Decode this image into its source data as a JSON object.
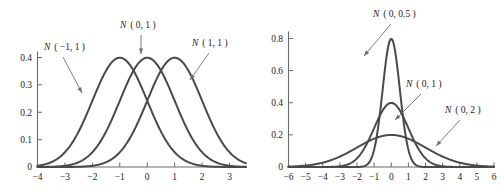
{
  "figure": {
    "title": "",
    "panels": [
      "left",
      "right"
    ]
  },
  "chart_data": [
    {
      "type": "line",
      "panel": "left",
      "title": "",
      "xlabel": "",
      "ylabel": "",
      "xlim": [
        -4,
        3.6
      ],
      "ylim": [
        0,
        0.42
      ],
      "xticks": [
        -4,
        -3,
        -2,
        -1,
        0,
        1,
        2,
        3
      ],
      "xticklabels": [
        "−4",
        "−3",
        "−2",
        "−1",
        "0",
        "1",
        "2",
        "3"
      ],
      "yticks": [
        0,
        0.1,
        0.2,
        0.3,
        0.4
      ],
      "yticklabels": [
        "0",
        "0.1",
        "0.2",
        "0.3",
        "0.4"
      ],
      "grid": false,
      "legend": "annotations",
      "series": [
        {
          "name": "N ( −1, 1 )",
          "label_plain": "N(-1,1)",
          "distribution": "normal",
          "mean": -1,
          "sigma": 1,
          "peak_value": 0.399,
          "peak_x": -1,
          "annotation": {
            "text_x": 44,
            "text_y": 50,
            "arrow_from_x": 63,
            "arrow_from_y": 57,
            "arrow_to_x": 82,
            "arrow_to_y": 93
          }
        },
        {
          "name": "N ( 0, 1 )",
          "label_plain": "N(0,1)",
          "distribution": "normal",
          "mean": 0,
          "sigma": 1,
          "peak_value": 0.399,
          "peak_x": 0,
          "annotation": {
            "text_x": 120,
            "text_y": 28,
            "arrow_from_x": 141,
            "arrow_from_y": 35,
            "arrow_to_x": 141,
            "arrow_to_y": 54
          }
        },
        {
          "name": "N ( 1, 1 )",
          "label_plain": "N(1,1)",
          "distribution": "normal",
          "mean": 1,
          "sigma": 1,
          "peak_value": 0.399,
          "peak_x": 1,
          "annotation": {
            "text_x": 192,
            "text_y": 46,
            "arrow_from_x": 209,
            "arrow_from_y": 53,
            "arrow_to_x": 190,
            "arrow_to_y": 80
          }
        }
      ]
    },
    {
      "type": "line",
      "panel": "right",
      "title": "",
      "xlabel": "",
      "ylabel": "",
      "xlim": [
        -6,
        6
      ],
      "ylim": [
        0,
        0.84
      ],
      "xticks": [
        -6,
        -5,
        -4,
        -3,
        -2,
        -1,
        0,
        1,
        2,
        3,
        4,
        5,
        6
      ],
      "xticklabels": [
        "−6",
        "−5",
        "−4",
        "−3",
        "−2",
        "−1",
        "0",
        "1",
        "2",
        "3",
        "4",
        "5",
        "6"
      ],
      "yticks": [
        0,
        0.2,
        0.4,
        0.6,
        0.8
      ],
      "yticklabels": [
        "0",
        "0.2",
        "0.4",
        "0.6",
        "0.8"
      ],
      "grid": false,
      "legend": "annotations",
      "series": [
        {
          "name": "N ( 0, 0.5 )",
          "label_plain": "N(0,0.5)",
          "distribution": "normal",
          "mean": 0,
          "sigma": 0.5,
          "peak_value": 0.798,
          "peak_x": 0,
          "annotation": {
            "text_x": 122,
            "text_y": 17,
            "arrow_from_x": 140,
            "arrow_from_y": 24,
            "arrow_to_x": 113,
            "arrow_to_y": 56
          }
        },
        {
          "name": "N ( 0, 1 )",
          "label_plain": "N(0,1)",
          "distribution": "normal",
          "mean": 0,
          "sigma": 1,
          "peak_value": 0.399,
          "peak_x": 0,
          "annotation": {
            "text_x": 155,
            "text_y": 87,
            "arrow_from_x": 170,
            "arrow_from_y": 94,
            "arrow_to_x": 144,
            "arrow_to_y": 120
          }
        },
        {
          "name": "N ( 0, 2 )",
          "label_plain": "N(0,2)",
          "distribution": "normal",
          "mean": 0,
          "sigma": 2,
          "peak_value": 0.199,
          "peak_x": 0,
          "annotation": {
            "text_x": 194,
            "text_y": 113,
            "arrow_from_x": 209,
            "arrow_from_y": 120,
            "arrow_to_x": 185,
            "arrow_to_y": 146
          }
        }
      ]
    }
  ]
}
